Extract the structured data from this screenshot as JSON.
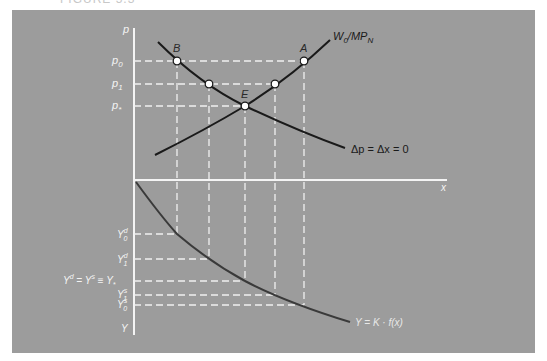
{
  "figure": {
    "title_fragment": "FIGURE 5.3",
    "background_color": "#9c9c9c",
    "axis_color": "#f4f4f4",
    "curve_color": "#1a1a1a",
    "lower_curve_color": "#3a3a3a"
  },
  "upper_panel": {
    "y_axis_label": "p",
    "x_axis_label": "x",
    "price_levels": [
      {
        "label": "p0",
        "main": "p",
        "sub": "0"
      },
      {
        "label": "p1",
        "main": "p",
        "sub": "1"
      },
      {
        "label": "p*",
        "main": "p",
        "sub": "*"
      }
    ],
    "curves": [
      {
        "name": "demand",
        "label": "Δp = Δx = 0"
      },
      {
        "name": "supply",
        "label_main": "W",
        "label_sub": "0",
        "label_mid": "/MP",
        "label_sub2": "N"
      }
    ],
    "points": [
      {
        "label": "B"
      },
      {
        "label": "A"
      },
      {
        "label": "E"
      }
    ]
  },
  "lower_panel": {
    "y_axis_label": "Y",
    "curve_label": "Y = K · f(x)",
    "output_levels": [
      {
        "label": "Y0d",
        "main": "Y",
        "sup": "d",
        "sub": "0"
      },
      {
        "label": "Y1d",
        "main": "Y",
        "sup": "d",
        "sub": "1"
      },
      {
        "label": "Yd = Ys ≡ Y*",
        "text": "Y",
        "sup1": "d",
        "eq1": " = Y",
        "sup2": "s",
        "eq2": " ≡ Y",
        "sub": "*"
      },
      {
        "label": "Y1s",
        "main": "Y",
        "sup": "s",
        "sub": "1"
      },
      {
        "label": "Y0s",
        "main": "Y",
        "sup": "s",
        "sub": "0"
      }
    ]
  }
}
